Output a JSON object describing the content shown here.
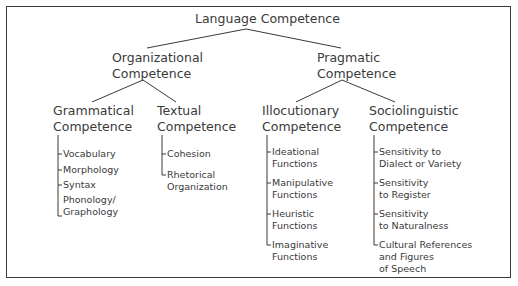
{
  "diagram": {
    "root": "Language Competence",
    "level1": [
      {
        "label_line1": "Organizational",
        "label_line2": "Competence"
      },
      {
        "label_line1": "Pragmatic",
        "label_line2": "Competence"
      }
    ],
    "level2": [
      {
        "label_line1": "Grammatical",
        "label_line2": "Competence",
        "items": [
          "Vocabulary",
          "Morphology",
          "Syntax",
          "Phonology/\nGraphology"
        ]
      },
      {
        "label_line1": "Textual",
        "label_line2": "Competence",
        "items": [
          "Cohesion",
          "Rhetorical\nOrganization"
        ]
      },
      {
        "label_line1": "Illocutionary",
        "label_line2": "Competence",
        "items": [
          "Ideational\nFunctions",
          "Manipulative\nFunctions",
          "Heuristic\nFunctions",
          "Imaginative\nFunctions"
        ]
      },
      {
        "label_line1": "Sociolinguistic",
        "label_line2": "Competence",
        "items": [
          "Sensitivity to\nDialect or Variety",
          "Sensitivity\nto Register",
          "Sensitivity\nto Naturalness",
          "Cultural References\nand Figures\nof Speech"
        ]
      }
    ],
    "line_color": "#3a3a3a"
  }
}
